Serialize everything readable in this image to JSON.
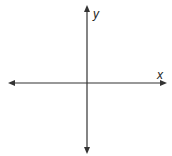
{
  "diagram": {
    "type": "cartesian-axes",
    "x_axis_label": "x",
    "y_axis_label": "y",
    "axis_color": "#333333",
    "background": "#ffffff",
    "origin": [
      87,
      83
    ],
    "x_axis_span": [
      8,
      167
    ],
    "y_axis_span": [
      5,
      154
    ],
    "arrows": [
      "left",
      "right",
      "up",
      "down"
    ]
  }
}
